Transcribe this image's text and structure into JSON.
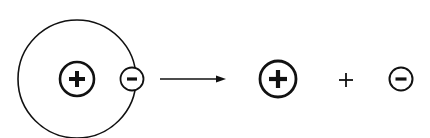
{
  "diagram": {
    "colors": {
      "stroke": "#111111",
      "background": "#ffffff"
    },
    "reactant": {
      "label": "Atom",
      "orbit": {
        "cx": 77,
        "cy": 79,
        "r": 59
      },
      "nucleus": {
        "label": "proton",
        "symbol": "+",
        "cx": 77,
        "cy": 79,
        "r": 18
      },
      "electron": {
        "label": "electron",
        "symbol": "−",
        "cx": 132,
        "cy": 79,
        "r": 12
      }
    },
    "arrow": {
      "label": "yields",
      "x1": 160,
      "x2": 226,
      "y": 79
    },
    "products": {
      "ion": {
        "label": "proton",
        "symbol": "+",
        "cx": 278,
        "cy": 79,
        "r": 18
      },
      "operator": "+",
      "electron": {
        "label": "electron",
        "symbol": "−",
        "cx": 401,
        "cy": 79,
        "r": 12
      }
    }
  }
}
